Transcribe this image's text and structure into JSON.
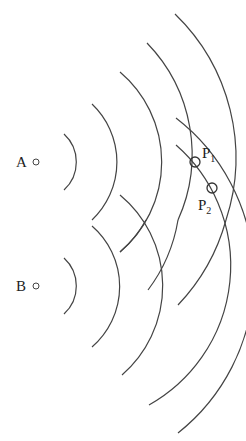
{
  "diagram": {
    "type": "two-source wave interference",
    "sources": [
      {
        "label": "A",
        "x": 36,
        "y": 162
      },
      {
        "label": "B",
        "x": 36,
        "y": 286
      }
    ],
    "wavefront_radii": [
      38,
      80,
      118,
      160,
      200
    ],
    "points": [
      {
        "label": "P",
        "sub": "1",
        "x": 195,
        "y": 162
      },
      {
        "label": "P",
        "sub": "2",
        "x": 212,
        "y": 188
      }
    ],
    "line_color": "#444444"
  }
}
